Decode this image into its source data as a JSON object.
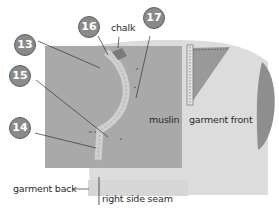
{
  "diagram": {
    "callouts": [
      {
        "id": "13",
        "label": "13"
      },
      {
        "id": "15",
        "label": "15"
      },
      {
        "id": "14",
        "label": "14"
      },
      {
        "id": "16",
        "label": "16"
      },
      {
        "id": "17",
        "label": "17"
      }
    ],
    "labels": {
      "chalk": "chalk",
      "muslin": "muslin",
      "garment_front": "garment front",
      "garment_back": "garment back",
      "right_side_seam": "right side seam"
    },
    "colors": {
      "garment": "#dcdcdc",
      "muslin": "#a9a9a9",
      "dart": "#999999",
      "sleeve": "#8e8e8e",
      "chalk": "#7a7a7a",
      "tape": "#cfcfcf",
      "badge_fill": "#8a8a8a",
      "leader": "#333333"
    }
  }
}
